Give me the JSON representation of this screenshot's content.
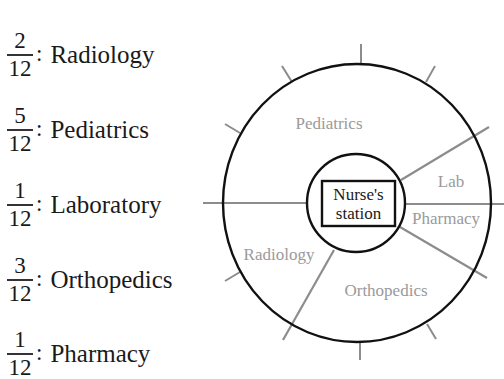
{
  "legend": {
    "items": [
      {
        "numerator": "2",
        "denominator": "12",
        "department": "Radiology"
      },
      {
        "numerator": "5",
        "denominator": "12",
        "department": "Pediatrics"
      },
      {
        "numerator": "1",
        "denominator": "12",
        "department": "Laboratory"
      },
      {
        "numerator": "3",
        "denominator": "12",
        "department": "Orthopedics"
      },
      {
        "numerator": "1",
        "denominator": "12",
        "department": "Pharmacy"
      }
    ]
  },
  "diagram": {
    "center_label_line1": "Nurse's",
    "center_label_line2": "station",
    "regions": {
      "pediatrics": "Pediatrics",
      "lab": "Lab",
      "pharmacy": "Pharmacy",
      "radiology": "Radiology",
      "orthopedics": "Orthopedics"
    },
    "colors": {
      "outline": "#111111",
      "divider": "#8c8c8c",
      "region_label": "#9a9a9a"
    }
  }
}
